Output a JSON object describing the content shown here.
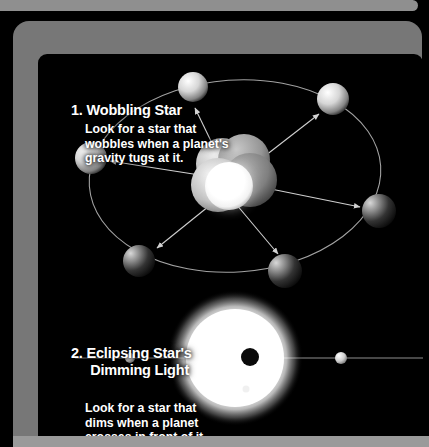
{
  "page": {
    "background_color": "#000000",
    "frame_color": "#777777",
    "rail_color": "#8f8f8f",
    "text_color": "#ffffff"
  },
  "sections": [
    {
      "number": "1.",
      "heading": "1. Wobbling Star",
      "body": "Look for a star that\nwobbles when a planet's\ngravity tugs at it.",
      "diagram": "wobbling-star-orbit-diagram"
    },
    {
      "number": "2.",
      "heading": "2. Eclipsing Star's\n     Dimming Light",
      "body": "Look for a star that\ndims when a planet\ncrosses in front of it.",
      "diagram": "eclipsing-star-transit-diagram"
    }
  ],
  "diagram_wobble": {
    "name": "wobbling-star-orbit-diagram",
    "orbit": {
      "cx": 197,
      "cy": 122,
      "rx": 146,
      "ry": 96,
      "rotation": -4,
      "stroke": "#b9b9b9"
    },
    "star_cluster": {
      "label": "wobbling-star",
      "lobes": [
        {
          "cx": 184,
          "cy": 110,
          "r": 26,
          "shade": "#c9c9c9"
        },
        {
          "cx": 206,
          "cy": 106,
          "r": 26,
          "shade": "#9f9f9f"
        },
        {
          "cx": 212,
          "cy": 126,
          "r": 27,
          "shade": "#8d8d8d"
        },
        {
          "cx": 180,
          "cy": 130,
          "r": 27,
          "shade": "#d5d5d5"
        }
      ],
      "bright_core": {
        "cx": 191,
        "cy": 132,
        "r": 24,
        "shade": "#ffffff"
      }
    },
    "planets": [
      {
        "id": "planet-top",
        "cx": 155,
        "cy": 33,
        "r": 15,
        "tone": "light"
      },
      {
        "id": "planet-upper-right",
        "cx": 295,
        "cy": 45,
        "r": 16,
        "tone": "light"
      },
      {
        "id": "planet-right",
        "cx": 341,
        "cy": 157,
        "r": 17,
        "tone": "dark"
      },
      {
        "id": "planet-bottom-right",
        "cx": 247,
        "cy": 217,
        "r": 17,
        "tone": "dark"
      },
      {
        "id": "planet-bottom-left",
        "cx": 101,
        "cy": 207,
        "r": 16,
        "tone": "dark"
      },
      {
        "id": "planet-left",
        "cx": 53,
        "cy": 104,
        "r": 16,
        "tone": "light"
      }
    ],
    "arrows": [
      {
        "id": "arrow-to-top",
        "x1": 185,
        "y1": 112,
        "x2": 157,
        "y2": 54
      },
      {
        "id": "arrow-to-upper-right",
        "x1": 214,
        "y1": 112,
        "x2": 281,
        "y2": 60
      },
      {
        "id": "arrow-to-right",
        "x1": 218,
        "y1": 132,
        "x2": 322,
        "y2": 153
      },
      {
        "id": "arrow-to-bottom-right",
        "x1": 198,
        "y1": 150,
        "x2": 240,
        "y2": 200
      },
      {
        "id": "arrow-to-bottom-left",
        "x1": 176,
        "y1": 148,
        "x2": 119,
        "y2": 194
      },
      {
        "id": "arrow-to-left",
        "x1": 168,
        "y1": 122,
        "x2": 72,
        "y2": 107
      }
    ]
  },
  "diagram_transit": {
    "name": "eclipsing-star-transit-diagram",
    "star": {
      "cx": 197,
      "cy": 304,
      "r": 50,
      "glow_r": 62,
      "color": "#ffffff"
    },
    "orbit_line": {
      "x1": 37,
      "y1": 304,
      "x2": 385,
      "y2": 304,
      "stroke": "#aaaaaa"
    },
    "transiting_planet": {
      "id": "transiting-planet-silhouette",
      "cx": 212,
      "cy": 303,
      "r": 9,
      "color": "#000000"
    },
    "planets": [
      {
        "id": "planet-orbit-left",
        "cx": 92,
        "cy": 304,
        "r": 5,
        "tone": "light"
      },
      {
        "id": "planet-orbit-right",
        "cx": 303,
        "cy": 304,
        "r": 6,
        "tone": "light"
      }
    ]
  }
}
